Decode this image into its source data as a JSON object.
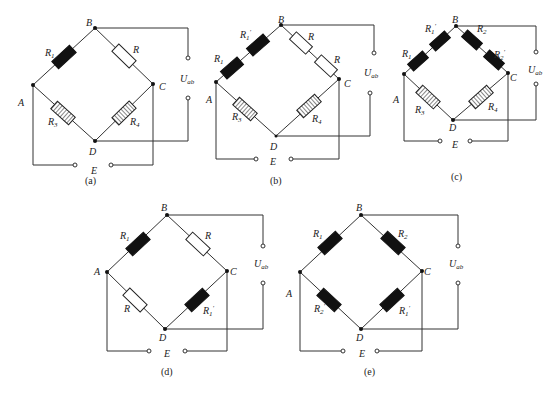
{
  "figure": {
    "subfigures": [
      {
        "id": "a",
        "caption": "(a)",
        "nodes": [
          "A",
          "B",
          "C",
          "D"
        ],
        "arms": {
          "AB": {
            "label": "R₁",
            "type": "strain-gauge-active"
          },
          "BC": {
            "label": "R",
            "type": "fixed-resistor"
          },
          "AD": {
            "label": "R₃",
            "type": "hatched-resistor"
          },
          "DC": {
            "label": "R₄",
            "type": "hatched-resistor"
          }
        },
        "output_label": "U_ab",
        "supply_label": "E"
      },
      {
        "id": "b",
        "caption": "(b)",
        "nodes": [
          "A",
          "B",
          "C",
          "D"
        ],
        "arms": {
          "AB": {
            "labels": [
              "R₁",
              "R₁′"
            ],
            "type": "two-strain-gauges-series"
          },
          "BC": {
            "labels": [
              "R",
              "R"
            ],
            "type": "two-fixed-resistors-series"
          },
          "AD": {
            "label": "R₃",
            "type": "hatched-resistor"
          },
          "DC": {
            "label": "R₄",
            "type": "hatched-resistor"
          }
        },
        "output_label": "U_ab",
        "supply_label": "E"
      },
      {
        "id": "c",
        "caption": "(c)",
        "nodes": [
          "A",
          "B",
          "C",
          "D"
        ],
        "arms": {
          "AB": {
            "labels": [
              "R₁",
              "R₁′"
            ],
            "type": "two-strain-gauges-series"
          },
          "BC": {
            "labels": [
              "R₂",
              "R₂′"
            ],
            "type": "two-strain-gauges-series"
          },
          "AD": {
            "label": "R₃",
            "type": "hatched-resistor"
          },
          "DC": {
            "label": "R₄",
            "type": "hatched-resistor"
          }
        },
        "output_label": "U_ab",
        "supply_label": "E"
      },
      {
        "id": "d",
        "caption": "(d)",
        "nodes": [
          "A",
          "B",
          "C",
          "D"
        ],
        "arms": {
          "AB": {
            "label": "R₁",
            "type": "strain-gauge-active"
          },
          "BC": {
            "label": "R",
            "type": "fixed-resistor"
          },
          "AD": {
            "label": "R",
            "type": "fixed-resistor"
          },
          "DC": {
            "label": "R₁′",
            "type": "strain-gauge-active"
          }
        },
        "output_label": "U_ab",
        "supply_label": "E"
      },
      {
        "id": "e",
        "caption": "(e)",
        "nodes": [
          "A",
          "B",
          "C",
          "D"
        ],
        "arms": {
          "AB": {
            "label": "R₁",
            "type": "strain-gauge-active"
          },
          "BC": {
            "label": "R₂",
            "type": "strain-gauge-active"
          },
          "AD": {
            "label": "R₂′",
            "type": "strain-gauge-active"
          },
          "DC": {
            "label": "R₁′",
            "type": "strain-gauge-active"
          }
        },
        "output_label": "U_ab",
        "supply_label": "E"
      }
    ]
  },
  "labels": {
    "A": "A",
    "B": "B",
    "C": "C",
    "D": "D",
    "E": "E",
    "U": "U",
    "ab": "ab",
    "R": "R",
    "R1": "R",
    "R1_sub": "1",
    "R2_sub": "2",
    "R3_sub": "3",
    "R4_sub": "4",
    "prime": "′",
    "cap_a": "(a)",
    "cap_b": "(b)",
    "cap_c": "(c)",
    "cap_d": "(d)",
    "cap_e": "(e)"
  }
}
